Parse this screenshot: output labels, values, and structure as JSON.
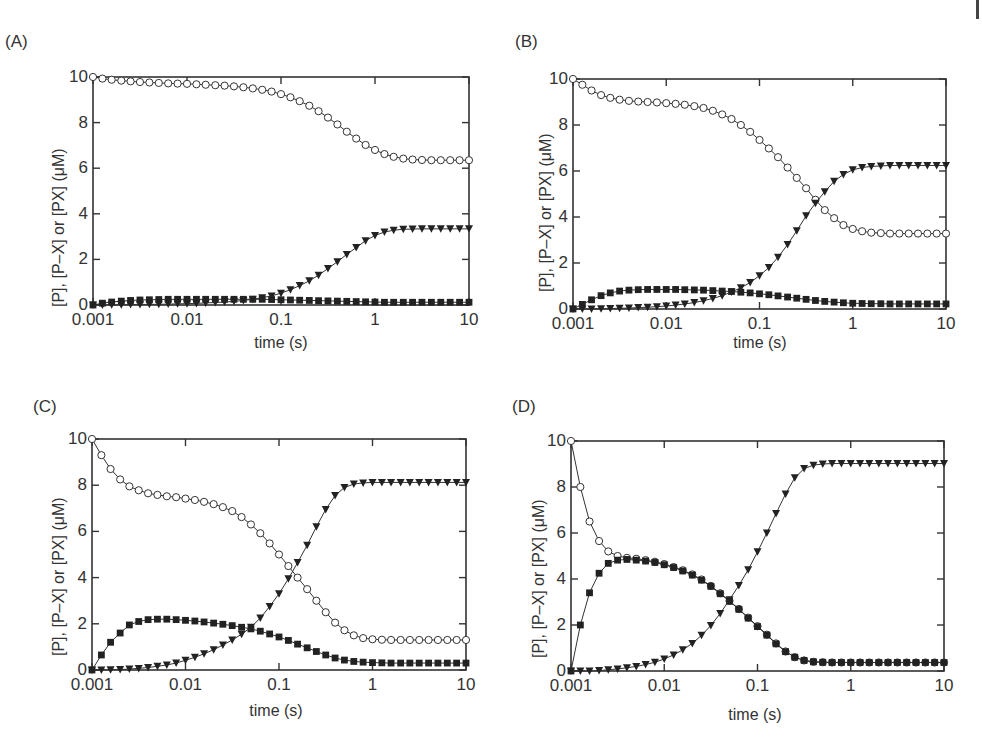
{
  "chart_data": [
    {
      "id": "A",
      "panel_label": "(A)",
      "type": "line",
      "title": "",
      "xlabel": "time (s)",
      "ylabel": "[P], [P–X] or [PX] (μM)",
      "xscale": "log",
      "xlim": [
        0.001,
        10
      ],
      "ylim": [
        0,
        10
      ],
      "xticks": [
        "0.001",
        "0.01",
        "0.1",
        "1",
        "10"
      ],
      "yticks": [
        "0",
        "2",
        "4",
        "6",
        "8",
        "10"
      ],
      "grid": false,
      "legend": null,
      "box": {
        "left": 93,
        "top": 77,
        "right": 469,
        "bottom": 305
      },
      "x": [
        0.001,
        0.00126,
        0.00158,
        0.002,
        0.00251,
        0.00316,
        0.00398,
        0.00501,
        0.00631,
        0.00794,
        0.01,
        0.0126,
        0.0158,
        0.02,
        0.0251,
        0.0316,
        0.0398,
        0.0501,
        0.0631,
        0.0794,
        0.1,
        0.126,
        0.158,
        0.2,
        0.251,
        0.316,
        0.398,
        0.501,
        0.631,
        0.794,
        1,
        1.26,
        1.58,
        2,
        2.51,
        3.16,
        3.98,
        5.01,
        6.31,
        7.94,
        10
      ],
      "series": [
        {
          "name": "[P]",
          "marker": "open-circle",
          "values": [
            10,
            9.93,
            9.88,
            9.84,
            9.81,
            9.78,
            9.76,
            9.74,
            9.72,
            9.71,
            9.7,
            9.68,
            9.66,
            9.64,
            9.62,
            9.59,
            9.55,
            9.5,
            9.44,
            9.36,
            9.25,
            9.11,
            8.94,
            8.74,
            8.5,
            8.22,
            7.92,
            7.6,
            7.3,
            7.02,
            6.8,
            6.62,
            6.5,
            6.42,
            6.38,
            6.36,
            6.35,
            6.35,
            6.35,
            6.35,
            6.35
          ]
        },
        {
          "name": "[P-X]",
          "marker": "filled-square",
          "values": [
            0,
            0.08,
            0.13,
            0.17,
            0.2,
            0.22,
            0.23,
            0.24,
            0.25,
            0.25,
            0.25,
            0.25,
            0.25,
            0.25,
            0.25,
            0.25,
            0.25,
            0.25,
            0.25,
            0.24,
            0.23,
            0.22,
            0.21,
            0.2,
            0.19,
            0.18,
            0.17,
            0.16,
            0.15,
            0.14,
            0.13,
            0.12,
            0.12,
            0.12,
            0.12,
            0.12,
            0.12,
            0.12,
            0.12,
            0.12,
            0.12
          ]
        },
        {
          "name": "[PX]",
          "marker": "filled-triangle-down",
          "values": [
            0,
            0,
            0.01,
            0.01,
            0.02,
            0.02,
            0.03,
            0.03,
            0.04,
            0.05,
            0.06,
            0.07,
            0.09,
            0.11,
            0.13,
            0.16,
            0.2,
            0.25,
            0.32,
            0.4,
            0.52,
            0.67,
            0.85,
            1.06,
            1.31,
            1.6,
            1.9,
            2.22,
            2.52,
            2.82,
            3.05,
            3.2,
            3.28,
            3.32,
            3.33,
            3.34,
            3.34,
            3.34,
            3.34,
            3.34,
            3.34
          ]
        }
      ]
    },
    {
      "id": "B",
      "panel_label": "(B)",
      "type": "line",
      "title": "",
      "xlabel": "time (s)",
      "ylabel": "[P], [P–X] or [PX] (μM)",
      "xscale": "log",
      "xlim": [
        0.001,
        10
      ],
      "ylim": [
        0,
        10
      ],
      "xticks": [
        "0.001",
        "0.01",
        "0.1",
        "1",
        "10"
      ],
      "yticks": [
        "0",
        "2",
        "4",
        "6",
        "8",
        "10"
      ],
      "grid": false,
      "legend": null,
      "box": {
        "left": 573,
        "top": 79,
        "right": 946,
        "bottom": 309
      },
      "x": [
        0.001,
        0.00126,
        0.00158,
        0.002,
        0.00251,
        0.00316,
        0.00398,
        0.00501,
        0.00631,
        0.00794,
        0.01,
        0.0126,
        0.0158,
        0.02,
        0.0251,
        0.0316,
        0.0398,
        0.0501,
        0.0631,
        0.0794,
        0.1,
        0.126,
        0.158,
        0.2,
        0.251,
        0.316,
        0.398,
        0.501,
        0.631,
        0.794,
        1,
        1.26,
        1.58,
        2,
        2.51,
        3.16,
        3.98,
        5.01,
        6.31,
        7.94,
        10
      ],
      "series": [
        {
          "name": "[P]",
          "marker": "open-circle",
          "values": [
            10,
            9.75,
            9.5,
            9.3,
            9.18,
            9.1,
            9.05,
            9.02,
            9.0,
            8.98,
            8.95,
            8.92,
            8.88,
            8.82,
            8.74,
            8.62,
            8.46,
            8.26,
            8.0,
            7.7,
            7.35,
            6.98,
            6.6,
            6.15,
            5.7,
            5.25,
            4.75,
            4.3,
            3.95,
            3.65,
            3.48,
            3.38,
            3.32,
            3.3,
            3.28,
            3.28,
            3.28,
            3.28,
            3.28,
            3.28,
            3.28
          ]
        },
        {
          "name": "[P-X]",
          "marker": "filled-square",
          "values": [
            0,
            0.2,
            0.4,
            0.58,
            0.7,
            0.78,
            0.82,
            0.84,
            0.85,
            0.85,
            0.85,
            0.85,
            0.84,
            0.83,
            0.82,
            0.8,
            0.78,
            0.76,
            0.73,
            0.7,
            0.66,
            0.62,
            0.57,
            0.52,
            0.47,
            0.42,
            0.37,
            0.33,
            0.3,
            0.27,
            0.25,
            0.24,
            0.23,
            0.23,
            0.22,
            0.22,
            0.22,
            0.22,
            0.22,
            0.22,
            0.22
          ]
        },
        {
          "name": "[PX]",
          "marker": "filled-triangle-down",
          "values": [
            0,
            0,
            0,
            0.01,
            0.02,
            0.03,
            0.04,
            0.06,
            0.08,
            0.1,
            0.13,
            0.17,
            0.22,
            0.28,
            0.36,
            0.46,
            0.58,
            0.74,
            0.92,
            1.15,
            1.45,
            1.8,
            2.25,
            2.8,
            3.4,
            4.05,
            4.6,
            5.1,
            5.55,
            5.85,
            6.05,
            6.15,
            6.2,
            6.22,
            6.24,
            6.24,
            6.24,
            6.24,
            6.24,
            6.24,
            6.24
          ]
        }
      ]
    },
    {
      "id": "C",
      "panel_label": "(C)",
      "type": "line",
      "title": "",
      "xlabel": "time (s)",
      "ylabel": "[P], [P–X] or [PX] (μM)",
      "xscale": "log",
      "xlim": [
        0.001,
        10
      ],
      "ylim": [
        0,
        10
      ],
      "xticks": [
        "0.001",
        "0.01",
        "0.1",
        "1",
        "10"
      ],
      "yticks": [
        "0",
        "2",
        "4",
        "6",
        "8",
        "10"
      ],
      "grid": false,
      "legend": null,
      "box": {
        "left": 92,
        "top": 439,
        "right": 466,
        "bottom": 670
      },
      "x": [
        0.001,
        0.00126,
        0.00158,
        0.002,
        0.00251,
        0.00316,
        0.00398,
        0.00501,
        0.00631,
        0.00794,
        0.01,
        0.0126,
        0.0158,
        0.02,
        0.0251,
        0.0316,
        0.0398,
        0.0501,
        0.0631,
        0.0794,
        0.1,
        0.126,
        0.158,
        0.2,
        0.251,
        0.316,
        0.398,
        0.501,
        0.631,
        0.794,
        1,
        1.26,
        1.58,
        2,
        2.51,
        3.16,
        3.98,
        5.01,
        6.31,
        7.94,
        10
      ],
      "series": [
        {
          "name": "[P]",
          "marker": "open-circle",
          "values": [
            10,
            9.3,
            8.7,
            8.25,
            7.95,
            7.78,
            7.65,
            7.58,
            7.52,
            7.48,
            7.42,
            7.36,
            7.28,
            7.18,
            7.05,
            6.88,
            6.62,
            6.3,
            5.92,
            5.48,
            5.0,
            4.5,
            4.0,
            3.5,
            3.0,
            2.5,
            2.05,
            1.72,
            1.5,
            1.38,
            1.33,
            1.31,
            1.3,
            1.3,
            1.3,
            1.3,
            1.3,
            1.3,
            1.3,
            1.3,
            1.3
          ]
        },
        {
          "name": "[P-X]",
          "marker": "filled-square",
          "values": [
            0,
            0.65,
            1.2,
            1.6,
            1.95,
            2.1,
            2.18,
            2.2,
            2.2,
            2.18,
            2.15,
            2.12,
            2.08,
            2.03,
            1.98,
            1.92,
            1.85,
            1.78,
            1.68,
            1.56,
            1.43,
            1.28,
            1.12,
            0.96,
            0.8,
            0.65,
            0.52,
            0.43,
            0.37,
            0.34,
            0.32,
            0.31,
            0.3,
            0.3,
            0.3,
            0.3,
            0.3,
            0.3,
            0.3,
            0.3,
            0.3
          ]
        },
        {
          "name": "[PX]",
          "marker": "filled-triangle-down",
          "values": [
            0,
            0,
            0.01,
            0.02,
            0.04,
            0.07,
            0.11,
            0.16,
            0.22,
            0.3,
            0.42,
            0.55,
            0.7,
            0.88,
            1.08,
            1.3,
            1.55,
            1.85,
            2.25,
            2.75,
            3.3,
            3.95,
            4.65,
            5.4,
            6.2,
            6.95,
            7.55,
            7.9,
            8.05,
            8.1,
            8.12,
            8.12,
            8.12,
            8.12,
            8.12,
            8.12,
            8.12,
            8.12,
            8.12,
            8.12,
            8.12
          ]
        }
      ]
    },
    {
      "id": "D",
      "panel_label": "(D)",
      "type": "line",
      "title": "",
      "xlabel": "time (s)",
      "ylabel": "[P], [P–X] or [PX] (μM)",
      "xscale": "log",
      "xlim": [
        0.001,
        10
      ],
      "ylim": [
        0,
        10
      ],
      "xticks": [
        "0.001",
        "0.01",
        "0.1",
        "1",
        "10"
      ],
      "yticks": [
        "0",
        "2",
        "4",
        "6",
        "8",
        "10"
      ],
      "grid": false,
      "legend": null,
      "box": {
        "left": 571,
        "top": 441,
        "right": 944,
        "bottom": 671
      },
      "x": [
        0.001,
        0.00126,
        0.00158,
        0.002,
        0.00251,
        0.00316,
        0.00398,
        0.00501,
        0.00631,
        0.00794,
        0.01,
        0.0126,
        0.0158,
        0.02,
        0.0251,
        0.0316,
        0.0398,
        0.0501,
        0.0631,
        0.0794,
        0.1,
        0.126,
        0.158,
        0.2,
        0.251,
        0.316,
        0.398,
        0.501,
        0.631,
        0.794,
        1,
        1.26,
        1.58,
        2,
        2.51,
        3.16,
        3.98,
        5.01,
        6.31,
        7.94,
        10
      ],
      "series": [
        {
          "name": "[P]",
          "marker": "open-circle",
          "values": [
            10,
            8.0,
            6.5,
            5.65,
            5.2,
            5.0,
            4.92,
            4.88,
            4.82,
            4.75,
            4.65,
            4.52,
            4.38,
            4.2,
            3.98,
            3.7,
            3.38,
            3.05,
            2.7,
            2.32,
            1.95,
            1.58,
            1.2,
            0.85,
            0.6,
            0.46,
            0.4,
            0.38,
            0.37,
            0.37,
            0.37,
            0.37,
            0.37,
            0.37,
            0.37,
            0.37,
            0.37,
            0.37,
            0.37,
            0.37,
            0.37
          ]
        },
        {
          "name": "[P-X]",
          "marker": "filled-square",
          "values": [
            0,
            2.0,
            3.4,
            4.25,
            4.68,
            4.82,
            4.85,
            4.82,
            4.78,
            4.72,
            4.62,
            4.5,
            4.35,
            4.17,
            3.95,
            3.68,
            3.36,
            3.03,
            2.68,
            2.3,
            1.93,
            1.56,
            1.18,
            0.84,
            0.6,
            0.46,
            0.4,
            0.38,
            0.37,
            0.37,
            0.37,
            0.37,
            0.37,
            0.37,
            0.37,
            0.37,
            0.37,
            0.37,
            0.37,
            0.37,
            0.37
          ]
        },
        {
          "name": "[PX]",
          "marker": "filled-triangle-down",
          "values": [
            0,
            0,
            0,
            0.02,
            0.05,
            0.09,
            0.14,
            0.2,
            0.28,
            0.38,
            0.52,
            0.7,
            0.92,
            1.2,
            1.55,
            1.98,
            2.5,
            3.1,
            3.72,
            4.4,
            5.18,
            6.0,
            6.85,
            7.7,
            8.4,
            8.8,
            8.95,
            9.0,
            9.02,
            9.02,
            9.02,
            9.02,
            9.02,
            9.02,
            9.02,
            9.02,
            9.02,
            9.02,
            9.02,
            9.02,
            9.02
          ]
        }
      ]
    }
  ],
  "styles": {
    "line_color": "#333333",
    "marker_fill": "#222222",
    "axis_color": "#333333",
    "text_color": "#333333"
  }
}
